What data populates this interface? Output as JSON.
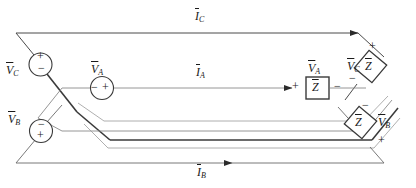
{
  "figure": {
    "background_color": "#ffffff",
    "line_color": "#3a3a3a",
    "text_color": "#1a1a1a",
    "width": 416,
    "height": 188
  },
  "currents": [
    {
      "id": "IC",
      "symbol": "I",
      "subscript": "C",
      "overbar": true,
      "position": "top",
      "arrow_direction": "right"
    },
    {
      "id": "IA",
      "symbol": "I",
      "subscript": "A",
      "overbar": true,
      "position": "middle",
      "arrow_direction": "right"
    },
    {
      "id": "IB",
      "symbol": "I",
      "subscript": "B",
      "overbar": true,
      "position": "bottom",
      "arrow_direction": "right"
    }
  ],
  "sources": [
    {
      "id": "VC",
      "symbol": "V",
      "subscript": "C",
      "overbar": true,
      "shape": "circle",
      "plus": "top",
      "minus": "bottom",
      "label_side": "left"
    },
    {
      "id": "VA",
      "symbol": "V",
      "subscript": "A",
      "overbar": true,
      "shape": "circle",
      "plus": "right",
      "minus": "left",
      "label_side": "above"
    },
    {
      "id": "VB",
      "symbol": "V",
      "subscript": "B",
      "overbar": true,
      "shape": "circle",
      "plus": "bottom",
      "minus": "top",
      "label_side": "left"
    }
  ],
  "loads": [
    {
      "id": "ZA",
      "symbol": "Z",
      "overbar": true,
      "shape": "box",
      "orientation": "horizontal",
      "voltage_label": "VA",
      "plus": "left",
      "minus": "right"
    },
    {
      "id": "ZC",
      "symbol": "Z",
      "overbar": true,
      "shape": "diamond",
      "orientation": "tilted",
      "voltage_label": "VC",
      "plus": "top",
      "minus": "bottom-left"
    },
    {
      "id": "ZB",
      "symbol": "Z",
      "overbar": true,
      "shape": "diamond",
      "orientation": "tilted",
      "voltage_label": "VB",
      "plus": "bottom",
      "minus": "top"
    }
  ],
  "labels": {
    "i_c": "I",
    "i_c_sub": "C",
    "i_a": "I",
    "i_a_sub": "A",
    "i_b": "I",
    "i_b_sub": "B",
    "v_c_left": "V",
    "v_c_left_sub": "C",
    "v_a_mid": "V",
    "v_a_mid_sub": "A",
    "v_b_left": "V",
    "v_b_left_sub": "B",
    "v_a_load": "V",
    "v_a_load_sub": "A",
    "v_c_load": "V",
    "v_c_load_sub": "C",
    "v_b_load": "V",
    "v_b_load_sub": "B",
    "z_a": "Z",
    "z_c": "Z",
    "z_b": "Z",
    "plus": "+",
    "minus": "−"
  }
}
